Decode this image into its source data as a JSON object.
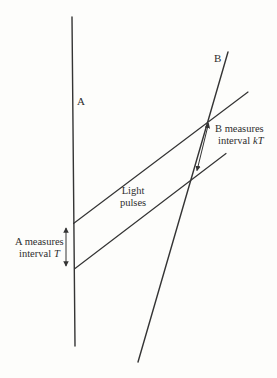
{
  "figure": {
    "worldline_a_label": "A",
    "worldline_b_label": "B",
    "light_pulses_label": {
      "line1": "Light",
      "line2": "pulses"
    },
    "b_interval": {
      "line1": "B measures",
      "line2_prefix": "interval",
      "line2_value": "kT"
    },
    "a_interval": {
      "line1": "A measures",
      "line2_prefix": "interval",
      "line2_value": "T"
    }
  },
  "colors": {
    "ink": "#343434",
    "paper": "#fdfdfb"
  }
}
